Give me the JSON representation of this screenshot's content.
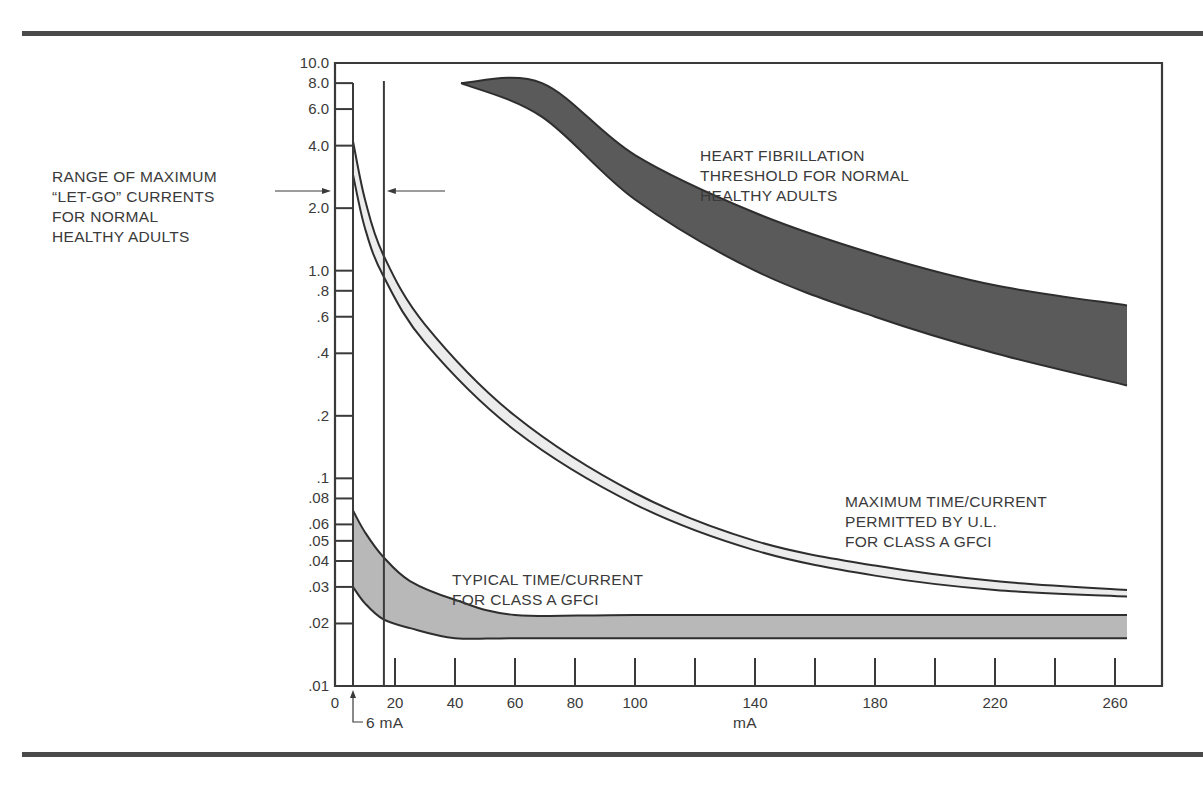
{
  "chart_data": {
    "type": "area",
    "title": "",
    "xlabel": "mA",
    "ylabel": "",
    "y_scale": "log",
    "xlim": [
      0,
      280
    ],
    "ylim": [
      0.01,
      10.0
    ],
    "x_ticks": [
      0,
      20,
      40,
      60,
      80,
      100,
      140,
      180,
      220,
      260
    ],
    "x_tick_labels": [
      "0",
      "20",
      "40",
      "60",
      "80",
      "100",
      "140",
      "180",
      "220",
      "260"
    ],
    "y_ticks": [
      10.0,
      8.0,
      6.0,
      4.0,
      2.0,
      1.0,
      0.8,
      0.6,
      0.4,
      0.2,
      0.1,
      0.08,
      0.06,
      0.05,
      0.04,
      0.03,
      0.02,
      0.01
    ],
    "y_tick_labels": [
      "10.0",
      "8.0",
      "6.0",
      "4.0",
      "2.0",
      "1.0",
      ".8",
      ".6",
      ".4",
      ".2",
      ".1",
      ".08",
      ".06",
      ".05",
      ".04",
      ".03",
      ".02",
      ".01"
    ],
    "grid": false,
    "series": [
      {
        "name": "HEART FIBRILLATION THRESHOLD FOR NORMAL HEALTHY ADULTS",
        "style": "dark band",
        "x": [
          42,
          69,
          100,
          140,
          180,
          220,
          264
        ],
        "upper": [
          8.0,
          8.0,
          3.6,
          1.9,
          1.2,
          0.85,
          0.68
        ],
        "lower": [
          8.0,
          5.5,
          2.2,
          1.0,
          0.6,
          0.4,
          0.28
        ]
      },
      {
        "name": "MAXIMUM TIME/CURRENT PERMITTED BY U.L. FOR CLASS A GFCI",
        "style": "light band",
        "x": [
          6,
          10,
          16,
          30,
          60,
          100,
          140,
          180,
          220,
          264
        ],
        "upper": [
          4.2,
          2.2,
          1.2,
          0.55,
          0.2,
          0.085,
          0.05,
          0.038,
          0.032,
          0.029
        ],
        "lower": [
          2.9,
          1.6,
          0.95,
          0.45,
          0.17,
          0.075,
          0.045,
          0.034,
          0.029,
          0.027
        ]
      },
      {
        "name": "TYPICAL TIME/CURRENT FOR CLASS A GFCI",
        "style": "medium gray band",
        "x": [
          6,
          10,
          16,
          25,
          40,
          60,
          100,
          180,
          264
        ],
        "upper": [
          0.07,
          0.055,
          0.042,
          0.032,
          0.026,
          0.022,
          0.022,
          0.022,
          0.022
        ],
        "lower": [
          0.03,
          0.025,
          0.021,
          0.019,
          0.017,
          0.017,
          0.017,
          0.017,
          0.017
        ]
      }
    ],
    "annotations": [
      {
        "text": "RANGE OF MAXIMUM “LET-GO” CURRENTS FOR NORMAL HEALTHY ADULTS",
        "x_range_mA": [
          6,
          16
        ]
      },
      {
        "text": "6 mA",
        "x_mA": 6
      }
    ]
  },
  "labels": {
    "let_go": "RANGE OF MAXIMUM\n“LET-GO” CURRENTS\nFOR NORMAL\nHEALTHY ADULTS",
    "fibrillation": "HEART FIBRILLATION\nTHRESHOLD FOR NORMAL\nHEALTHY ADULTS",
    "ul_max": "MAXIMUM TIME/CURRENT\nPERMITTED BY U.L.\nFOR CLASS A GFCI",
    "typical": "TYPICAL TIME/CURRENT\nFOR CLASS A GFCI",
    "six_ma": "6 mA",
    "x_unit": "mA"
  },
  "colors": {
    "fibrillation_band": "#5a5a5a",
    "ul_band": "#ececec",
    "typical_band": "#b8b8b8",
    "ink": "#3a3a3a"
  }
}
